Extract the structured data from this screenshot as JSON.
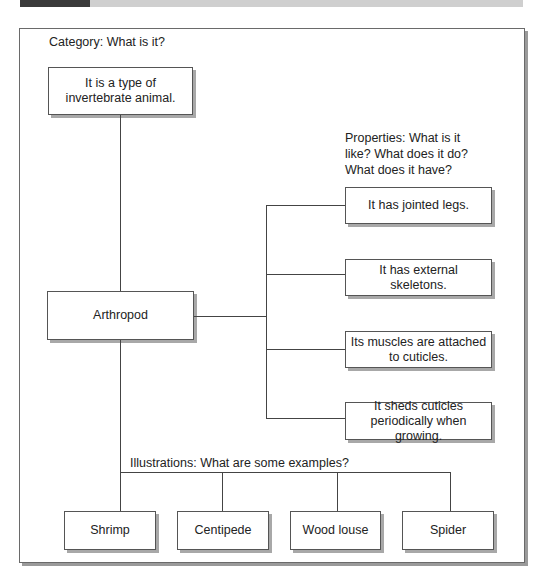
{
  "diagram": {
    "category": {
      "heading": "Category: What is it?",
      "box": "It is a type of invertebrate animal."
    },
    "center": {
      "label": "Arthropod"
    },
    "properties": {
      "heading": "Properties: What is it like? What does it do? What does it have?",
      "items": [
        "It has jointed legs.",
        "It has external skeletons.",
        "Its muscles are attached to cuticles.",
        "It sheds cuticles periodically when growing."
      ]
    },
    "illustrations": {
      "heading": "Illustrations: What are some examples?",
      "items": [
        "Shrimp",
        "Centipede",
        "Wood louse",
        "Spider"
      ]
    }
  },
  "colors": {
    "topbar_dark": "#3a3a3a",
    "topbar_light": "#cfcfcf",
    "border": "#555555",
    "shadow": "#a8a8a8"
  }
}
